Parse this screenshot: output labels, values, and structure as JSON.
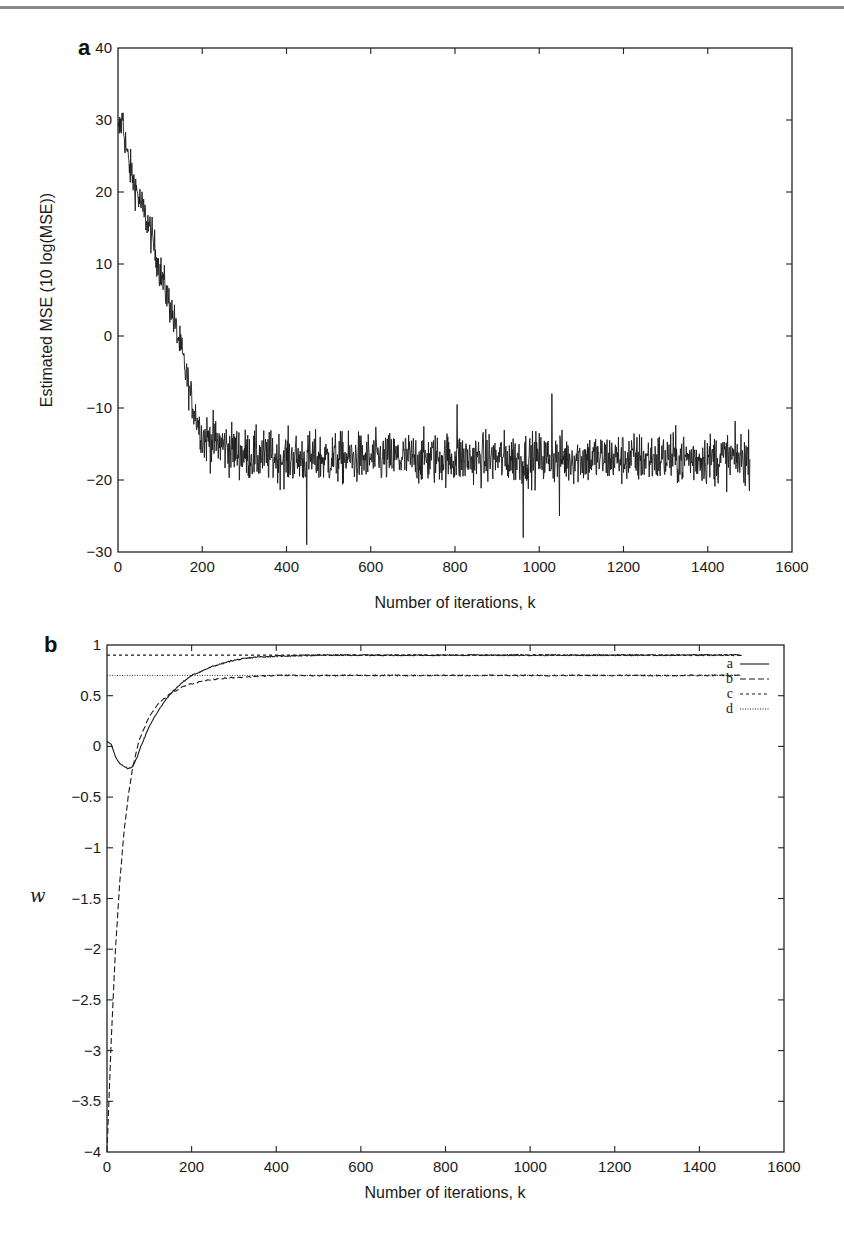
{
  "chart_data": [
    {
      "panel": "a",
      "type": "line",
      "title": "",
      "xlabel": "Number of iterations, k",
      "ylabel": "Estimated MSE  (10 log(MSE))",
      "xlim": [
        0,
        1600
      ],
      "ylim": [
        -30,
        40
      ],
      "xticks": [
        0,
        200,
        400,
        600,
        800,
        1000,
        1200,
        1400,
        1600
      ],
      "yticks": [
        -30,
        -20,
        -10,
        0,
        10,
        20,
        30,
        40
      ],
      "grid": false,
      "series": [
        {
          "name": "Estimated MSE",
          "style": "solid",
          "description": "Noisy learning curve: starts near 30 dB, decays roughly linearly to about -14 dB by k=200, then fluctuates around -17 dB (range approx -23 to -11) until k=1500",
          "trend_x": [
            0,
            10,
            25,
            50,
            75,
            100,
            125,
            150,
            175,
            200,
            300,
            400,
            600,
            800,
            1000,
            1200,
            1400,
            1500
          ],
          "trend_y": [
            28,
            30,
            24,
            19,
            15,
            9,
            4,
            -2,
            -9,
            -14,
            -16.5,
            -17,
            -17,
            -17,
            -17,
            -17,
            -17,
            -17
          ],
          "noise_amplitude": 3,
          "notable_points": [
            {
              "x": 12,
              "y": 31
            },
            {
              "x": 448,
              "y": -29
            },
            {
              "x": 805,
              "y": -9.5
            },
            {
              "x": 962,
              "y": -28
            },
            {
              "x": 1030,
              "y": -8
            },
            {
              "x": 1048,
              "y": -25
            }
          ]
        }
      ]
    },
    {
      "panel": "b",
      "type": "line",
      "title": "",
      "xlabel": "Number of iterations, k",
      "ylabel": "w",
      "xlim": [
        0,
        1600
      ],
      "ylim": [
        -4,
        1
      ],
      "xticks": [
        0,
        200,
        400,
        600,
        800,
        1000,
        1200,
        1400,
        1600
      ],
      "yticks": [
        -4,
        -3.5,
        -3,
        -2.5,
        -2,
        -1.5,
        -1,
        -0.5,
        0,
        0.5,
        1
      ],
      "ytick_labels": [
        "−4",
        "−3.5",
        "−3",
        "−2.5",
        "−2",
        "−1.5",
        "−1",
        "−0.5",
        "0",
        "0.5",
        "1"
      ],
      "grid": false,
      "legend_position": "upper right",
      "series": [
        {
          "name": "a",
          "style": "solid",
          "x": [
            0,
            10,
            20,
            30,
            40,
            50,
            60,
            70,
            80,
            100,
            125,
            150,
            175,
            200,
            250,
            300,
            350,
            400,
            500,
            600,
            800,
            1000,
            1200,
            1400,
            1500
          ],
          "y": [
            0.05,
            0.02,
            -0.1,
            -0.17,
            -0.2,
            -0.22,
            -0.2,
            -0.12,
            0.0,
            0.2,
            0.38,
            0.52,
            0.62,
            0.7,
            0.79,
            0.85,
            0.88,
            0.89,
            0.9,
            0.9,
            0.9,
            0.9,
            0.9,
            0.9,
            0.9
          ]
        },
        {
          "name": "b",
          "style": "dashed",
          "x": [
            0,
            10,
            20,
            30,
            40,
            50,
            60,
            75,
            100,
            125,
            150,
            175,
            200,
            250,
            300,
            350,
            400,
            500,
            600,
            800,
            1000,
            1200,
            1400,
            1500
          ],
          "y": [
            -4.0,
            -2.9,
            -2.0,
            -1.35,
            -0.85,
            -0.5,
            -0.22,
            0.05,
            0.3,
            0.44,
            0.52,
            0.58,
            0.62,
            0.66,
            0.68,
            0.69,
            0.7,
            0.7,
            0.7,
            0.7,
            0.7,
            0.7,
            0.7,
            0.7
          ]
        },
        {
          "name": "c",
          "style": "short-dashed",
          "x": [
            0,
            1500
          ],
          "y": [
            0.9,
            0.9
          ]
        },
        {
          "name": "d",
          "style": "dotted",
          "x": [
            0,
            1500
          ],
          "y": [
            0.7,
            0.7
          ]
        }
      ]
    }
  ],
  "figure": {
    "panel_a": {
      "label": "a",
      "xlabel": "Number of iterations, k",
      "ylabel": "Estimated MSE  (10 log(MSE))",
      "xtick_labels": [
        "0",
        "200",
        "400",
        "600",
        "800",
        "1000",
        "1200",
        "1400",
        "1600"
      ],
      "ytick_labels": [
        "−30",
        "−20",
        "−10",
        "0",
        "10",
        "20",
        "30",
        "40"
      ]
    },
    "panel_b": {
      "label": "b",
      "xlabel": "Number of iterations, k",
      "ylabel": "w",
      "xtick_labels": [
        "0",
        "200",
        "400",
        "600",
        "800",
        "1000",
        "1200",
        "1400",
        "1600"
      ],
      "ytick_labels": [
        "−4",
        "−3.5",
        "−3",
        "−2.5",
        "−2",
        "−1.5",
        "−1",
        "−0.5",
        "0",
        "0.5",
        "1"
      ],
      "legend": [
        "a",
        "b",
        "c",
        "d"
      ]
    }
  },
  "colors": {
    "line": "#1a1a1a",
    "axis": "#222222",
    "rule": "#8a8a8a"
  }
}
